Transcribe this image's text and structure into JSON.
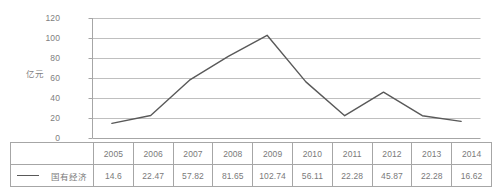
{
  "chart_data": {
    "type": "line",
    "title": "",
    "xlabel": "",
    "ylabel": "亿元",
    "categories": [
      "2005",
      "2006",
      "2007",
      "2008",
      "2009",
      "2010",
      "2011",
      "2012",
      "2013",
      "2014"
    ],
    "series": [
      {
        "name": "国有经济",
        "values": [
          14.6,
          22.47,
          57.82,
          81.65,
          102.74,
          56.11,
          22.28,
          45.87,
          22.28,
          16.62
        ]
      }
    ],
    "ylim": [
      0,
      120
    ],
    "yticks": [
      0,
      20,
      40,
      60,
      80,
      100,
      120
    ],
    "ytick_labels": [
      "0",
      "20",
      "40",
      "60",
      "80",
      "100",
      "120"
    ],
    "grid": true,
    "legend_position": "table-left",
    "line_color": "#595959",
    "grid_color": "#bfbfbf",
    "axis_color": "#a6a6a6"
  },
  "table": {
    "legend_label": "国有经济",
    "header_row": [
      "2005",
      "2006",
      "2007",
      "2008",
      "2009",
      "2010",
      "2011",
      "2012",
      "2013",
      "2014"
    ],
    "value_row": [
      "14.6",
      "22.47",
      "57.82",
      "81.65",
      "102.74",
      "56.11",
      "22.28",
      "45.87",
      "22.28",
      "16.62"
    ]
  },
  "axis": {
    "y_title": "亿元",
    "y_labels": [
      "120",
      "100",
      "80",
      "60",
      "40",
      "20",
      "0"
    ]
  }
}
